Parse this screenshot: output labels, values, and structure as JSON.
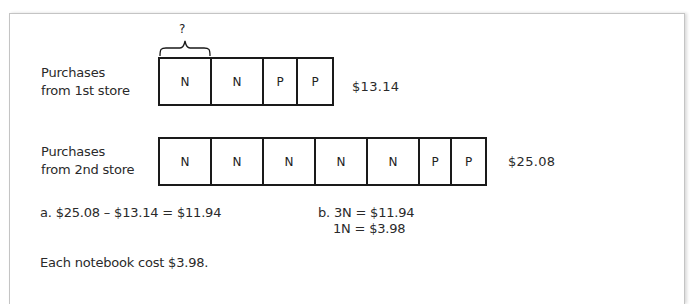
{
  "diagram": {
    "question_mark": "?",
    "rows": [
      {
        "label_line1": "Purchases",
        "label_line2": "from 1st store",
        "cells": [
          "N",
          "N",
          "P",
          "P"
        ],
        "total": "$13.14"
      },
      {
        "label_line1": "Purchases",
        "label_line2": "from 2nd store",
        "cells": [
          "N",
          "N",
          "N",
          "N",
          "N",
          "P",
          "P"
        ],
        "total": "$25.08"
      }
    ],
    "step_a": "a. $25.08 – $13.14 = $11.94",
    "step_b_line1": "b. 3N = $11.94",
    "step_b_line2": "1N = $3.98",
    "conclusion": "Each notebook cost $3.98."
  }
}
